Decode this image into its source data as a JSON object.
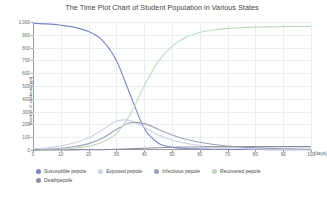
{
  "chart_data": {
    "type": "line",
    "title": "The Time Plot Chart  of Student Population in Various States",
    "xlabel": "(days)",
    "ylabel": "Number of students (ppl)",
    "xlim": [
      0,
      100
    ],
    "ylim": [
      0,
      1000
    ],
    "grid": true,
    "legend_position": "bottom-left",
    "xticks": [
      "0",
      "10",
      "20",
      "30",
      "40",
      "50",
      "60",
      "70",
      "80",
      "90",
      "100"
    ],
    "yticks": [
      "0",
      "100",
      "200",
      "300",
      "400",
      "500",
      "600",
      "700",
      "800",
      "900",
      "1,000"
    ],
    "x": [
      0,
      5,
      10,
      15,
      20,
      25,
      30,
      35,
      40,
      45,
      50,
      55,
      60,
      65,
      70,
      75,
      80,
      85,
      90,
      95,
      100
    ],
    "series": [
      {
        "name": "Susceptible pepole",
        "color": "#7b86c4",
        "values": [
          990,
          985,
          975,
          958,
          925,
          855,
          700,
          430,
          170,
          55,
          22,
          12,
          8,
          6,
          5,
          4,
          4,
          3,
          3,
          3,
          3
        ]
      },
      {
        "name": "Exposed pepole",
        "color": "#cdd3e6",
        "values": [
          10,
          18,
          32,
          56,
          96,
          158,
          225,
          230,
          178,
          120,
          78,
          52,
          35,
          24,
          17,
          12,
          9,
          7,
          5,
          4,
          3
        ]
      },
      {
        "name": "Infectious pepole",
        "color": "#9aa3b5",
        "values": [
          0,
          6,
          14,
          27,
          50,
          92,
          160,
          213,
          206,
          163,
          118,
          84,
          60,
          43,
          31,
          23,
          17,
          13,
          10,
          8,
          6
        ]
      },
      {
        "name": "Recovered pepole",
        "color": "#bcd9bc",
        "values": [
          0,
          2,
          6,
          14,
          30,
          62,
          130,
          280,
          500,
          690,
          810,
          880,
          918,
          938,
          950,
          956,
          960,
          962,
          964,
          965,
          966
        ]
      },
      {
        "name": "Deathpepole",
        "color": "#8a8fa0",
        "values": [
          0,
          0,
          0,
          1,
          2,
          3,
          5,
          9,
          14,
          18,
          21,
          23,
          24,
          25,
          25,
          26,
          26,
          26,
          26,
          26,
          26
        ]
      }
    ]
  }
}
